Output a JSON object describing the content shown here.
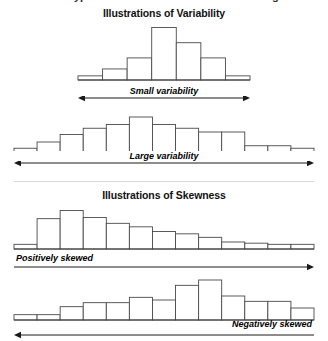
{
  "figure": {
    "cutoff_text_left": "ypes",
    "cutoff_text_right": "g",
    "sections": [
      {
        "id": "variability",
        "title": "Illustrations of Variability"
      },
      {
        "id": "skewness",
        "title": "Illustrations of Skewness"
      }
    ]
  },
  "chart_data": [
    {
      "type": "bar",
      "id": "small-variability",
      "title": "Small variability",
      "label": "Small variability",
      "arrow": "double",
      "label_align": "center",
      "xlabel": "",
      "ylabel": "",
      "grid": false,
      "legend": null,
      "categories": [
        "1",
        "2",
        "3",
        "4",
        "5",
        "6",
        "7"
      ],
      "values": [
        3,
        8,
        16,
        38,
        27,
        16,
        3
      ],
      "ylim": [
        0,
        42
      ],
      "plot_left": 78,
      "plot_width": 172
    },
    {
      "type": "bar",
      "id": "large-variability",
      "title": "Large variability",
      "label": "Large variability",
      "arrow": "double",
      "label_align": "center",
      "xlabel": "",
      "ylabel": "",
      "grid": false,
      "legend": null,
      "categories": [
        "1",
        "2",
        "3",
        "4",
        "5",
        "6",
        "7",
        "8",
        "9",
        "10",
        "11",
        "12",
        "13"
      ],
      "values": [
        3,
        8,
        14,
        19,
        22,
        28,
        22,
        19,
        16,
        16,
        5,
        5,
        3
      ],
      "ylim": [
        0,
        32
      ],
      "plot_left": 14,
      "plot_width": 300
    },
    {
      "type": "bar",
      "id": "positively-skewed",
      "title": "Positively skewed",
      "label": "Positively skewed",
      "arrow": "right",
      "label_align": "left",
      "xlabel": "",
      "ylabel": "",
      "grid": false,
      "legend": null,
      "categories": [
        "1",
        "2",
        "3",
        "4",
        "5",
        "6",
        "7",
        "8",
        "9",
        "10",
        "11",
        "12",
        "13"
      ],
      "values": [
        4,
        26,
        33,
        27,
        22,
        19,
        15,
        13,
        10,
        6,
        5,
        4,
        4
      ],
      "ylim": [
        0,
        36
      ],
      "plot_left": 14,
      "plot_width": 300
    },
    {
      "type": "bar",
      "id": "negatively-skewed",
      "title": "Negatively skewed",
      "label": "Negatively skewed",
      "arrow": "left",
      "label_align": "right",
      "xlabel": "",
      "ylabel": "",
      "grid": false,
      "legend": null,
      "categories": [
        "1",
        "2",
        "3",
        "4",
        "5",
        "6",
        "7",
        "8",
        "9",
        "10",
        "11",
        "12",
        "13"
      ],
      "values": [
        4,
        4,
        10,
        13,
        13,
        17,
        15,
        26,
        30,
        18,
        14,
        14,
        9
      ],
      "ylim": [
        0,
        33
      ],
      "plot_left": 14,
      "plot_width": 300
    }
  ]
}
